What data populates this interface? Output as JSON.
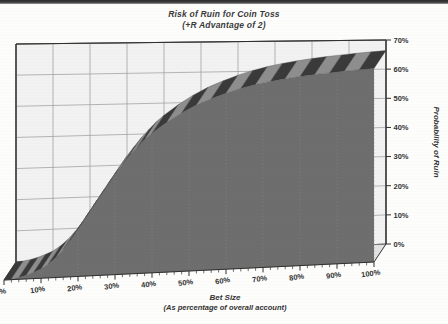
{
  "chart_data": {
    "type": "area",
    "title": "Risk of Ruin for Coin Toss",
    "subtitle": "(+R Advantage of 2)",
    "xlabel": "Bet Size",
    "xlabel_sub": "(As percentage of overall account)",
    "ylabel": "Probability of Ruin",
    "xlim": [
      0,
      100
    ],
    "ylim": [
      0,
      70
    ],
    "grid": true,
    "legend": "none",
    "style_3d": true,
    "x_tick_labels": [
      "0%",
      "10%",
      "20%",
      "30%",
      "40%",
      "50%",
      "60%",
      "70%",
      "80%",
      "90%",
      "100%"
    ],
    "y_tick_labels": [
      "0%",
      "10%",
      "20%",
      "30%",
      "40%",
      "50%",
      "60%",
      "70%"
    ],
    "x_ticks": [
      0,
      10,
      20,
      30,
      40,
      50,
      60,
      70,
      80,
      90,
      100
    ],
    "y_ticks": [
      0,
      10,
      20,
      30,
      40,
      50,
      60,
      70
    ],
    "x": [
      0,
      2,
      4,
      6,
      8,
      10,
      12,
      14,
      16,
      18,
      20,
      22,
      24,
      26,
      28,
      30,
      32,
      34,
      36,
      38,
      40,
      44,
      48,
      52,
      56,
      60,
      64,
      68,
      72,
      76,
      80,
      84,
      88,
      92,
      96,
      100
    ],
    "values": [
      0,
      0.2,
      0.6,
      1.2,
      2.0,
      3.0,
      4.5,
      6.5,
      9.0,
      12.0,
      15.5,
      19.0,
      22.5,
      26.0,
      29.5,
      33.0,
      36.0,
      39.0,
      41.5,
      44.0,
      46.0,
      49.5,
      52.5,
      55.0,
      57.0,
      58.8,
      60.3,
      61.5,
      62.5,
      63.3,
      64.0,
      64.6,
      65.1,
      65.6,
      66.0,
      66.4
    ],
    "series_name": "Probability of Ruin",
    "colors": {
      "area_fill": "#6e6e6e",
      "ribbon_dark": "#3a3a3a",
      "ribbon_light": "#b9b9b9",
      "back_wall": "#f2f2f2",
      "floor": "#e2e2e2",
      "grid_line": "#9a9a9a",
      "axis_line": "#2f2f2f",
      "text": "#333333"
    }
  },
  "axes": {
    "y_axis_title": "Probability of Ruin",
    "x_axis_title": "Bet Size",
    "x_axis_subtitle": "(As percentage of overall account)"
  },
  "title": {
    "main": "Risk of Ruin for Coin Toss",
    "sub": "(+R Advantage of 2)"
  }
}
